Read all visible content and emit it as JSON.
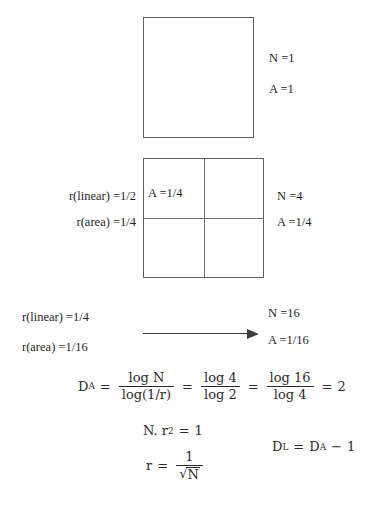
{
  "figure": {
    "background_color": "#ffffff",
    "line_color": "#5b5f63",
    "text_color": "#1f1f1f"
  },
  "stage_one": {
    "label_n": "N =1",
    "label_a": "A =1"
  },
  "stage_two": {
    "label_r_linear": "r(linear) =1/2",
    "label_r_area": "r(area) =1/4",
    "cell_label": "A =1/4",
    "label_n": "N =4",
    "label_a": "A =1/4"
  },
  "stage_three": {
    "label_r_linear": "r(linear) =1/4",
    "label_r_area": "r(area) =1/16",
    "label_n": "N =16",
    "label_a": "A =1/16",
    "arrow": "right-arrow"
  },
  "equations": {
    "da": {
      "lhs": "D",
      "lhs_sub": "A",
      "eq1": "=",
      "f1_num": "log N",
      "f1_den": "log(1/r)",
      "eq2": "=",
      "f2_num": "log 4",
      "f2_den": "log 2",
      "eq3": "=",
      "f3_num": "log 16",
      "f3_den": "log 4",
      "eq4": "=",
      "result": "2"
    },
    "nr2": {
      "lhs": "N. r",
      "exp": "2",
      "eq": "=",
      "rhs": "1"
    },
    "r_sqrt": {
      "lhs": "r",
      "eq": "=",
      "num": "1",
      "den_radical": "√",
      "den_body": "N"
    },
    "dl": {
      "lhs": "D",
      "lhs_sub": "L",
      "eq": "=",
      "rhs": "D",
      "rhs_sub": "A",
      "minus": "−",
      "one": "1"
    }
  }
}
